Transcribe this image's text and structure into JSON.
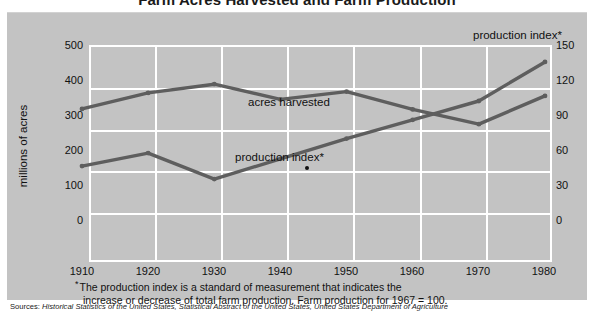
{
  "title": "Farm Acres Harvested and Farm Production",
  "axis": {
    "left_title": "millions of acres",
    "right_title": "production index*",
    "left_ticks": [
      "500",
      "400",
      "300",
      "200",
      "100",
      "0"
    ],
    "right_ticks": [
      "150",
      "120",
      "90",
      "60",
      "30",
      "0"
    ],
    "x_ticks": [
      "1910",
      "1920",
      "1930",
      "1940",
      "1950",
      "1960",
      "1970",
      "1980"
    ]
  },
  "annotations": {
    "acres_label": "acres harvested",
    "index_label": "production index*"
  },
  "footnote": {
    "star": "*",
    "line1": "The production index is a standard of measurement that indicates the",
    "line2": "increase or decrease of total farm production. Farm production for 1967  =  100."
  },
  "sources": {
    "label": "Sources:",
    "text": " Historical Statistics of the United States, Statistical Abstract of the United States, United States Department of Agriculture"
  },
  "colors": {
    "panel": "#c3c3c3",
    "gridline": "#ffffff",
    "series": "#5e5e5e",
    "text": "#111111"
  },
  "chart_data": {
    "type": "line",
    "title": "Farm Acres Harvested and Farm Production",
    "xlabel": "",
    "ylabel": "millions of acres",
    "y2label": "production index*",
    "x": [
      1910,
      1920,
      1930,
      1940,
      1950,
      1960,
      1970,
      1980
    ],
    "xlim": [
      1910,
      1980
    ],
    "ylim": [
      0,
      500
    ],
    "y2lim": [
      0,
      150
    ],
    "grid": true,
    "legend": "inline-annotations",
    "series": [
      {
        "name": "acres harvested",
        "axis": "left",
        "units": "millions of acres",
        "values": [
          325,
          362,
          382,
          347,
          365,
          324,
          290,
          355
        ]
      },
      {
        "name": "production index*",
        "axis": "right",
        "units": "index (1967 = 100)",
        "values": [
          58,
          67,
          49,
          63,
          77,
          90,
          103,
          130
        ]
      }
    ],
    "markers": [
      {
        "name": "reference-dot",
        "x": 1944,
        "y_index": 57
      }
    ]
  }
}
